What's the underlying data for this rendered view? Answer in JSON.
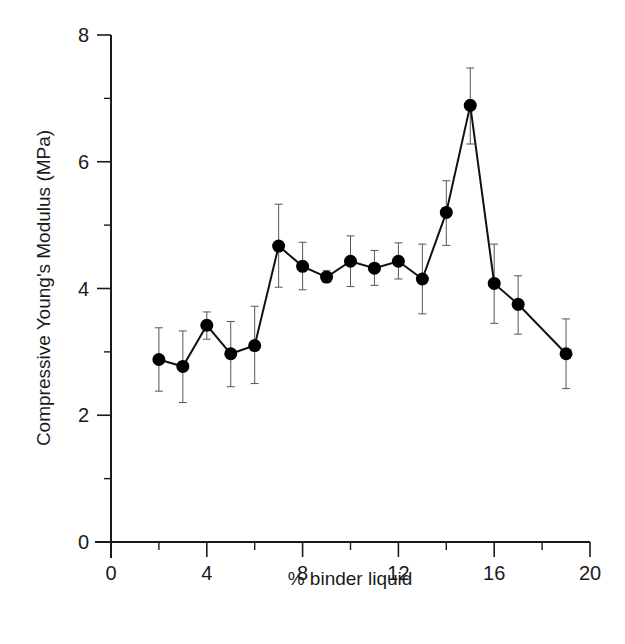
{
  "chart_data": {
    "type": "line",
    "title": "",
    "xlabel": "% binder liquid",
    "ylabel": "Compressive Young's Modulus (MPa)",
    "xlim": [
      0,
      20
    ],
    "ylim": [
      0,
      8
    ],
    "x_ticks": [
      0,
      4,
      8,
      12,
      16,
      20
    ],
    "x_minor_ticks": [
      2,
      6,
      10,
      14,
      18
    ],
    "y_ticks": [
      0,
      2,
      4,
      6,
      8
    ],
    "y_minor_ticks": [
      1,
      3,
      5,
      7
    ],
    "grid": false,
    "legend": null,
    "series": [
      {
        "name": "Compressive Young's Modulus",
        "marker": "filled-circle",
        "color": "#000000",
        "x": [
          2,
          3,
          4,
          5,
          6,
          7,
          8,
          9,
          10,
          11,
          12,
          13,
          14,
          15,
          16,
          17,
          19
        ],
        "values": [
          2.88,
          2.77,
          3.42,
          2.97,
          3.1,
          4.67,
          4.35,
          4.18,
          4.43,
          4.32,
          4.43,
          4.15,
          5.2,
          6.89,
          4.08,
          3.75,
          2.97
        ],
        "error_low": [
          2.38,
          2.2,
          3.2,
          2.45,
          2.5,
          4.02,
          3.98,
          4.1,
          4.03,
          4.05,
          4.15,
          3.6,
          4.68,
          6.28,
          3.45,
          3.28,
          2.42
        ],
        "error_high": [
          3.38,
          3.33,
          3.63,
          3.48,
          3.72,
          5.33,
          4.73,
          4.28,
          4.83,
          4.6,
          4.72,
          4.7,
          5.7,
          7.48,
          4.7,
          4.2,
          3.52
        ]
      }
    ]
  },
  "labels": {
    "x_title": "% binder liquid",
    "y_title": "Compressive Young's Modulus (MPa)",
    "x_tick_labels": [
      "0",
      "4",
      "8",
      "12",
      "16",
      "20"
    ],
    "y_tick_labels": [
      "0",
      "2",
      "4",
      "6",
      "8"
    ]
  },
  "colors": {
    "axis": "#1a1a1a",
    "line": "#111111",
    "marker": "#000000",
    "errorbar": "#555555"
  }
}
